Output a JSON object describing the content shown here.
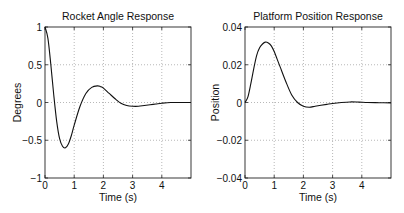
{
  "chart_data": [
    {
      "type": "line",
      "title": "Rocket Angle Response",
      "xlabel": "Time (s)",
      "ylabel": "Degrees",
      "xlim": [
        0,
        5
      ],
      "ylim": [
        -1,
        1
      ],
      "grid": true,
      "xticks": [
        "0",
        "1",
        "2",
        "3",
        "4"
      ],
      "yticks": [
        "-1",
        "-0.5",
        "0",
        "0.5",
        "1"
      ],
      "series": [
        {
          "name": "angle",
          "x": [
            0,
            0.1,
            0.2,
            0.3,
            0.4,
            0.5,
            0.6,
            0.7,
            0.8,
            0.9,
            1.0,
            1.2,
            1.4,
            1.6,
            1.8,
            1.9,
            2.0,
            2.2,
            2.4,
            2.6,
            2.8,
            3.0,
            3.2,
            3.4,
            3.6,
            3.8,
            4.0,
            4.3,
            4.6,
            5.0
          ],
          "y": [
            1.0,
            0.85,
            0.5,
            0.1,
            -0.25,
            -0.48,
            -0.58,
            -0.6,
            -0.55,
            -0.44,
            -0.3,
            -0.05,
            0.12,
            0.2,
            0.22,
            0.21,
            0.19,
            0.12,
            0.05,
            -0.01,
            -0.04,
            -0.05,
            -0.05,
            -0.04,
            -0.03,
            -0.02,
            -0.01,
            0.0,
            0.0,
            0.0
          ]
        }
      ]
    },
    {
      "type": "line",
      "title": "Platform Position Response",
      "xlabel": "Time (s)",
      "ylabel": "Position",
      "xlim": [
        0,
        5
      ],
      "ylim": [
        -0.04,
        0.04
      ],
      "grid": true,
      "xticks": [
        "0",
        "1",
        "2",
        "3",
        "4"
      ],
      "yticks": [
        "-0.04",
        "-0.02",
        "0",
        "0.02",
        "0.04"
      ],
      "series": [
        {
          "name": "position",
          "x": [
            0,
            0.1,
            0.2,
            0.3,
            0.4,
            0.5,
            0.6,
            0.7,
            0.8,
            0.9,
            1.0,
            1.1,
            1.2,
            1.4,
            1.6,
            1.8,
            2.0,
            2.2,
            2.4,
            2.6,
            2.8,
            3.0,
            3.3,
            3.6,
            3.9,
            4.2,
            4.6,
            5.0
          ],
          "y": [
            0.0,
            0.003,
            0.01,
            0.018,
            0.025,
            0.029,
            0.031,
            0.032,
            0.0315,
            0.03,
            0.027,
            0.023,
            0.019,
            0.011,
            0.004,
            0.0,
            -0.002,
            -0.0025,
            -0.002,
            -0.0015,
            -0.001,
            -0.0005,
            0.0,
            0.0003,
            0.0002,
            0.0,
            -0.0001,
            -0.0002
          ]
        }
      ]
    }
  ],
  "labels": {
    "left_title": "Rocket Angle Response",
    "left_xlabel": "Time (s)",
    "left_ylabel": "Degrees",
    "right_title": "Platform Position Response",
    "right_xlabel": "Time (s)",
    "right_ylabel": "Position"
  }
}
